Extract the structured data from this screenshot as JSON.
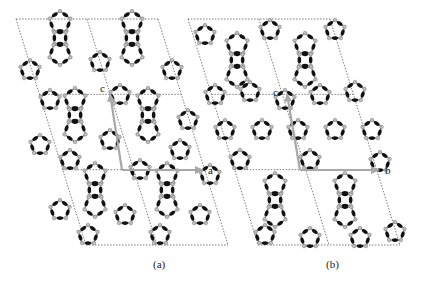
{
  "figure": {
    "panels": [
      {
        "id": "a",
        "caption": "(a)",
        "axes": [
          {
            "label": "c",
            "direction": "up-left"
          },
          {
            "label": "a",
            "direction": "right"
          }
        ],
        "unit_cell_grid": {
          "columns": 2,
          "rows": 3
        }
      },
      {
        "id": "b",
        "caption": "(b)",
        "axes": [
          {
            "label": "c",
            "direction": "up-left"
          },
          {
            "label": "b",
            "direction": "right"
          }
        ],
        "unit_cell_grid": {
          "columns": 2,
          "rows": 3
        }
      }
    ],
    "colors": {
      "oxygen_atoms": "#111111",
      "tetrahedral_atoms": "#bdbdbd",
      "bonds": "#9a9a9a",
      "axis_arrows": "#a8a8a8",
      "unit_cell_lines": "#444444"
    }
  }
}
